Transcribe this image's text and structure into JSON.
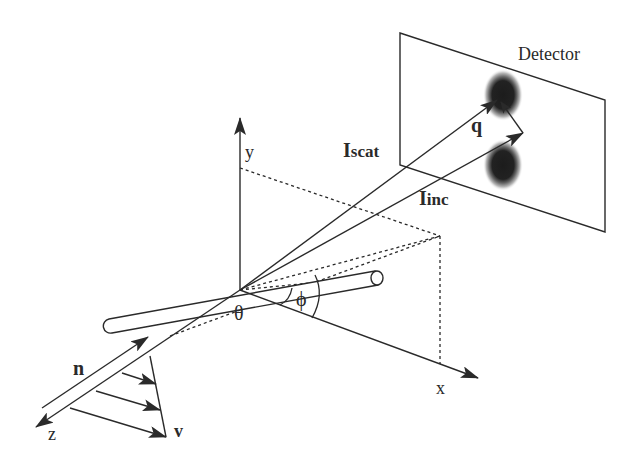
{
  "figure": {
    "type": "scattering-geometry",
    "labels": {
      "detector": "Detector",
      "q": "q",
      "i_scat_main": "I",
      "i_scat_sub": "scat",
      "i_inc_main": "I",
      "i_inc_sub": "inc",
      "axis_x": "x",
      "axis_y": "y",
      "axis_z": "z",
      "n": "n",
      "v": "v",
      "theta": "θ",
      "phi": "ϕ"
    },
    "colors": {
      "ink": "#2a2a2a",
      "spot": "#1c1c1c",
      "background": "#ffffff"
    }
  }
}
